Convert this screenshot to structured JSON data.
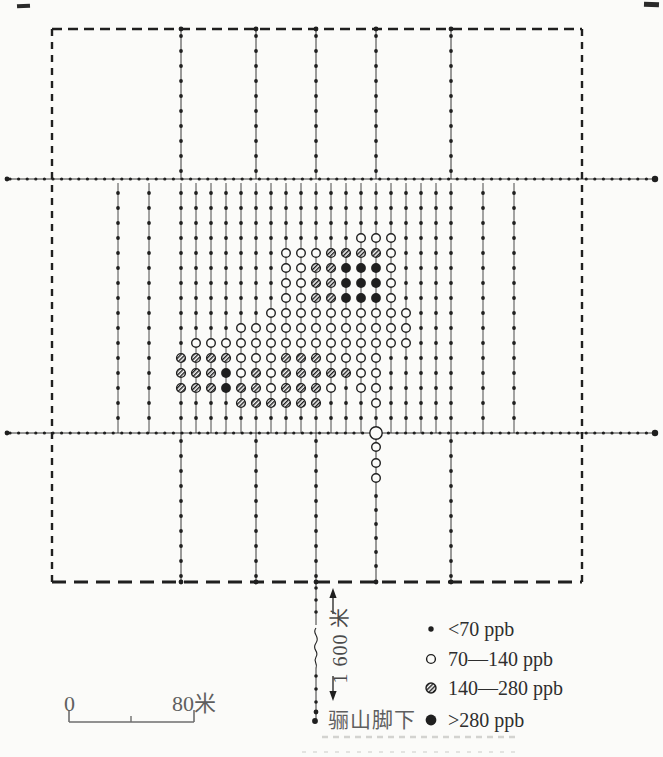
{
  "colors": {
    "ink": "#1f1f1f",
    "paper": "#fbfbf9",
    "label_gray": "#5f5f5f",
    "legend_text": "#2e2e2e",
    "artifact_gray": "#d3d3d0"
  },
  "map": {
    "boundary": {
      "x": 52,
      "y": 29,
      "width": 530,
      "height": 553
    },
    "survey_lines_y": [
      179,
      433
    ],
    "line_x_start": 6,
    "line_x_end": 656,
    "h_dot_step": 8.6,
    "long_line_xs": [
      181,
      256,
      316,
      376,
      451
    ],
    "v_dot_step": 15,
    "band_top": 183,
    "first_dot_y": 193,
    "circle_row_start_index": 3,
    "band_columns": [
      {
        "x": 118,
        "pattern": "............"
      },
      {
        "x": 149,
        "pattern": "............"
      },
      {
        "x": 181,
        "pattern": "........hhh."
      },
      {
        "x": 196,
        "pattern": ".......ohhh."
      },
      {
        "x": 211,
        "pattern": ".......ohhh."
      },
      {
        "x": 226,
        "pattern": ".......ohbb."
      },
      {
        "x": 241,
        "pattern": "......oooohh"
      },
      {
        "x": 256,
        "pattern": "......ooohhh"
      },
      {
        "x": 271,
        "pattern": ".....ooooooh"
      },
      {
        "x": 286,
        "pattern": ".ooooooohhhh"
      },
      {
        "x": 301,
        "pattern": ".ooooooohhhh"
      },
      {
        "x": 316,
        "pattern": ".ohhhooohhhh"
      },
      {
        "x": 331,
        "pattern": ".hhhhooooho."
      },
      {
        "x": 346,
        "pattern": ".hbbbooooh.."
      },
      {
        "x": 361,
        "pattern": "ohbbboooooo."
      },
      {
        "x": 376,
        "pattern": "ohbbbooooooo"
      },
      {
        "x": 391,
        "pattern": "oooooooo...."
      },
      {
        "x": 406,
        "pattern": ".....ooo...."
      },
      {
        "x": 421,
        "pattern": "............"
      },
      {
        "x": 436,
        "pattern": "............"
      },
      {
        "x": 451,
        "pattern": "............"
      },
      {
        "x": 483,
        "pattern": "............"
      },
      {
        "x": 514,
        "pattern": "............"
      }
    ],
    "below_line": {
      "x": 376,
      "big_circle_y": 433,
      "open_ys": [
        447,
        463,
        478
      ],
      "dot_ys": [
        496,
        510,
        524,
        538,
        552,
        566
      ]
    },
    "foot_line": {
      "x": 316,
      "upper_dot_ys": [
        588,
        600,
        612
      ],
      "squiggle_y1": 628,
      "squiggle_y2": 668,
      "lower_dot_ys": [
        676,
        689,
        702
      ],
      "end_dot_ys": [
        712,
        721
      ]
    }
  },
  "annotations": {
    "distance_label": "1 600 米",
    "foot_label": "骊山脚下"
  },
  "scale_bar": {
    "zero_label": "0",
    "end_label": "80米",
    "x1": 69,
    "x2": 194,
    "y": 722,
    "mid_x": 131,
    "tick_h": 12,
    "mid_tick_h": 6
  },
  "legend": {
    "x_symbol": 431,
    "x_text": 448,
    "row_ys": [
      629,
      659,
      688,
      720
    ],
    "items": [
      {
        "symbol": "dot",
        "label": "<70 ppb"
      },
      {
        "symbol": "open",
        "label": "70—140 ppb"
      },
      {
        "symbol": "hatched",
        "label": "140—280 ppb"
      },
      {
        "symbol": "black",
        "label": ">280 ppb"
      }
    ]
  }
}
